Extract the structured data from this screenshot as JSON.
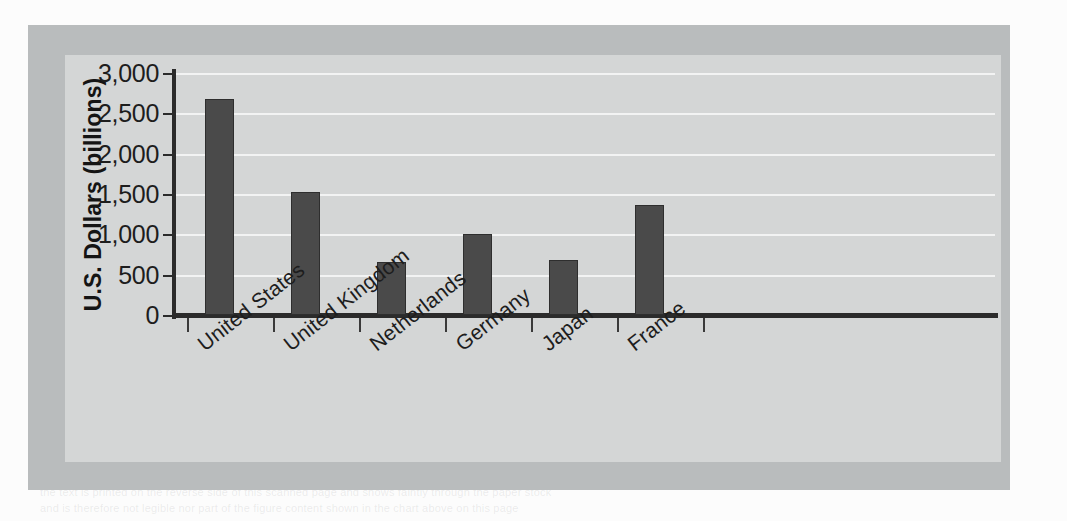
{
  "chart_data": {
    "type": "bar",
    "title": "",
    "subtitle": "",
    "xlabel": "",
    "ylabel": "U.S. Dollars (billions)",
    "categories": [
      "United States",
      "United Kingdom",
      "Netherlands",
      "Germany",
      "Japan",
      "France"
    ],
    "values": [
      2680,
      1520,
      660,
      1000,
      680,
      1360
    ],
    "series": [
      {
        "name": "U.S. Dollars (billions)",
        "values": [
          2680,
          1520,
          660,
          1000,
          680,
          1360
        ]
      }
    ],
    "ylim": [
      0,
      3000
    ],
    "ytick_values": [
      0,
      500,
      1000,
      1500,
      2000,
      2500,
      3000
    ],
    "ytick_labels": [
      "0",
      "500",
      "1,000",
      "1,500",
      "2,000",
      "2,500",
      "3,000"
    ],
    "grid": true,
    "grid_axis": "y",
    "legend": false,
    "legend_position": "none",
    "bar_color": "#4a4a4a",
    "gridline_color": "#f2f3f3",
    "plot_background": "#d4d6d6",
    "frame_background": "#b9bcbd",
    "axis_color": "#2b2b2b",
    "text_color": "#1d1d1d",
    "xlabel_rotation": -38
  },
  "showthrough": {
    "line1": "the text is printed on the reverse side of this scanned page and shows faintly through the paper stock",
    "line2": "and is therefore not legible nor part of the figure content shown in the chart above on this page"
  }
}
